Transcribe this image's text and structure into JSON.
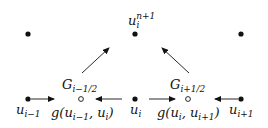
{
  "diagram": {
    "nodes": [
      {
        "id": "top-left",
        "type": "filled",
        "x": 28,
        "y": 34
      },
      {
        "id": "top-center",
        "type": "filled",
        "x": 135,
        "y": 34,
        "label": "u_i^{n+1}"
      },
      {
        "id": "top-right",
        "type": "filled",
        "x": 241,
        "y": 34
      },
      {
        "id": "u-i-minus-1",
        "type": "filled",
        "x": 28,
        "y": 99,
        "label": "u_{i-1}"
      },
      {
        "id": "flux-left",
        "type": "hollow",
        "x": 81,
        "y": 99,
        "label": "g(u_{i-1}, u_i)",
        "upper_label": "G_{i-1/2}"
      },
      {
        "id": "u-i",
        "type": "filled",
        "x": 135,
        "y": 99,
        "label": "u_i"
      },
      {
        "id": "flux-right",
        "type": "hollow",
        "x": 188,
        "y": 99,
        "label": "g(u_i, u_{i+1})",
        "upper_label": "G_{i+1/2}"
      },
      {
        "id": "u-i-plus-1",
        "type": "filled",
        "x": 241,
        "y": 99,
        "label": "u_{i+1}"
      }
    ],
    "labels": {
      "top": {
        "base": "u",
        "sub": "i",
        "sup": "n+1"
      },
      "G_left": {
        "base": "G",
        "sub": "i−1/2"
      },
      "G_right": {
        "base": "G",
        "sub": "i+1/2"
      },
      "u_im1": {
        "base": "u",
        "sub": "i−1"
      },
      "u_i": {
        "base": "u",
        "sub": "i"
      },
      "u_ip1": {
        "base": "u",
        "sub": "i+1"
      },
      "g_left": {
        "pre": "g(u",
        "s1": "i−1",
        "mid": ", u",
        "s2": "i",
        "post": ")"
      },
      "g_right": {
        "pre": "g(u",
        "s1": "i",
        "mid": ", u",
        "s2": "i+1",
        "post": ")"
      }
    },
    "colors": {
      "ink": "#111111",
      "background": "#ffffff"
    }
  }
}
